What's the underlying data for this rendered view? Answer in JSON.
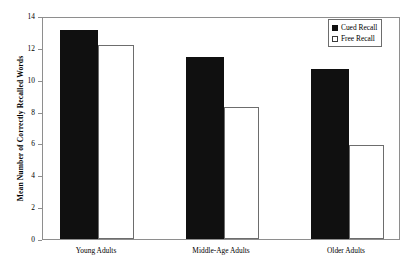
{
  "chart_data": {
    "type": "bar",
    "title": "",
    "xlabel": "",
    "ylabel": "Mean Number of Correctly Recalled Words",
    "ylim": [
      0,
      14
    ],
    "yticks": [
      0,
      2,
      4,
      6,
      8,
      10,
      12,
      14
    ],
    "ytick_labels": [
      "0",
      "2",
      "4",
      "6",
      "8",
      "10",
      "12",
      "14"
    ],
    "grid": false,
    "legend_position": "top-right-inside",
    "categories": [
      "Young Adults",
      "Middle-Age Adults",
      "Older Adults"
    ],
    "series": [
      {
        "name": "Cued Recall",
        "values": [
          13.1,
          11.4,
          10.7
        ],
        "color": "#101010",
        "style": "filled"
      },
      {
        "name": "Free Recall",
        "values": [
          12.2,
          8.3,
          5.9
        ],
        "color": "#ffffff",
        "style": "open"
      }
    ]
  },
  "legend": {
    "items": [
      {
        "label": "Cued Recall",
        "swatch": "filled-square-icon"
      },
      {
        "label": "Free Recall",
        "swatch": "open-square-icon"
      }
    ]
  }
}
